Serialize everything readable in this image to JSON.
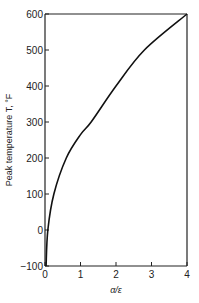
{
  "chart_data": {
    "type": "line",
    "title": "",
    "xlabel": "α/ε",
    "ylabel": "Peak temperature T, °F",
    "xlim": [
      0,
      4
    ],
    "ylim": [
      -100,
      600
    ],
    "x_ticks": [
      "0",
      "1",
      "2",
      "3",
      "4"
    ],
    "y_ticks": [
      "600",
      "500",
      "400",
      "300",
      "200",
      "100",
      "0",
      "−100"
    ],
    "grid": false,
    "legend": null,
    "series": [
      {
        "name": "Peak temperature",
        "x": [
          0.03,
          0.08,
          0.25,
          0.6,
          1.0,
          1.3,
          2.0,
          2.8,
          4.0
        ],
        "y": [
          -100,
          0,
          100,
          200,
          265,
          300,
          400,
          500,
          600
        ]
      }
    ]
  }
}
